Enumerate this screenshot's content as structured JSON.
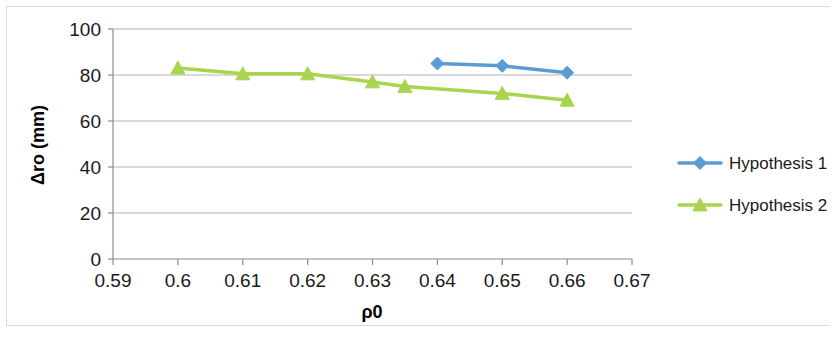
{
  "chart_data": {
    "type": "line",
    "title": "",
    "xlabel": "ρ0",
    "ylabel": "Δro (mm)",
    "xlim": [
      0.59,
      0.67
    ],
    "ylim": [
      0,
      100
    ],
    "xticks": [
      "0.59",
      "0.6",
      "0.61",
      "0.62",
      "0.63",
      "0.64",
      "0.65",
      "0.66",
      "0.67"
    ],
    "xtick_values": [
      0.59,
      0.6,
      0.61,
      0.62,
      0.63,
      0.64,
      0.65,
      0.66,
      0.67
    ],
    "yticks": [
      "0",
      "20",
      "40",
      "60",
      "80",
      "100"
    ],
    "ytick_values": [
      0,
      20,
      40,
      60,
      80,
      100
    ],
    "grid": "horizontal",
    "legend_position": "right",
    "series": [
      {
        "name": "Hypothesis 1",
        "color": "#5B9BD5",
        "marker": "diamond",
        "x": [
          0.64,
          0.65,
          0.66
        ],
        "values": [
          85,
          84,
          81
        ]
      },
      {
        "name": "Hypothesis 2",
        "color": "#A9D44E",
        "marker": "triangle",
        "x": [
          0.6,
          0.61,
          0.62,
          0.63,
          0.635,
          0.65,
          0.66
        ],
        "values": [
          83,
          80.5,
          80.5,
          77,
          75,
          72,
          69
        ]
      }
    ]
  },
  "legend": {
    "items": [
      {
        "label": "Hypothesis 1",
        "color": "#5B9BD5",
        "marker": "diamond"
      },
      {
        "label": "Hypothesis 2",
        "color": "#A9D44E",
        "marker": "triangle"
      }
    ]
  },
  "colors": {
    "series1": "#5B9BD5",
    "series2": "#A9D44E",
    "gridline": "#b3b3b3",
    "axis": "#8c8c8c",
    "text": "#1a1a1a",
    "background": "#ffffff"
  }
}
